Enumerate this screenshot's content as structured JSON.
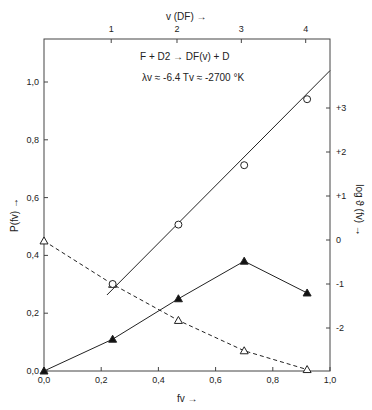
{
  "chart_data": {
    "type": "line",
    "annotation": {
      "reaction": "F + D2 → DF(v) + D",
      "parameters": "λv ≈ -6.4   Tv ≈ -2700 °K"
    },
    "xlabel": "fv →",
    "ylabel": "P(fv) →",
    "y2label": "log ϑ (fv) →",
    "x2label": "v (DF) →",
    "xlim": [
      0.0,
      1.0
    ],
    "ylim": [
      0.0,
      1.1
    ],
    "y2lim": [
      -2.8,
      3.9
    ],
    "x_ticks": [
      "0,0",
      "0,2",
      "0,4",
      "0,6",
      "0,8",
      "1,0"
    ],
    "y_ticks": [
      "0,0",
      "0,2",
      "0,4",
      "0,6",
      "0,8",
      "1,0"
    ],
    "y2_ticks": [
      "-2",
      "-1",
      "0",
      "+1",
      "+2",
      "+3"
    ],
    "x2_ticks": [
      {
        "label": "1",
        "fv": 0.235
      },
      {
        "label": "2",
        "fv": 0.465
      },
      {
        "label": "3",
        "fv": 0.69
      },
      {
        "label": "4",
        "fv": 0.915
      }
    ],
    "grid": false,
    "series": [
      {
        "name": "P(fv) dashed, open triangles",
        "axis": "left",
        "style": "dashed",
        "marker": "open-triangle",
        "x": [
          0.0,
          0.24,
          0.47,
          0.7,
          0.92
        ],
        "y": [
          0.45,
          0.3,
          0.175,
          0.07,
          0.005
        ]
      },
      {
        "name": "Product distribution, filled triangles",
        "axis": "left",
        "style": "solid",
        "marker": "filled-triangle",
        "x": [
          0.0,
          0.24,
          0.47,
          0.7,
          0.92
        ],
        "y": [
          0.0,
          0.11,
          0.25,
          0.38,
          0.27
        ]
      },
      {
        "name": "log ϑ(fv), open circles with linear fit",
        "axis": "right",
        "style": "solid",
        "marker": "open-circle",
        "x": [
          0.24,
          0.47,
          0.7,
          0.92
        ],
        "y": [
          -1.0,
          0.35,
          1.7,
          3.2
        ],
        "fit_line": {
          "x": [
            0.22,
            1.0
          ],
          "y": [
            -1.25,
            3.85
          ]
        }
      }
    ]
  }
}
